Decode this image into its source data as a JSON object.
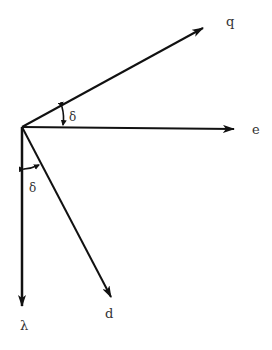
{
  "diagram": {
    "type": "vector-diagram",
    "origin": {
      "x": 22,
      "y": 127
    },
    "colors": {
      "line": "#111111",
      "text": "#333333",
      "background": "#ffffff"
    },
    "vectors": [
      {
        "id": "q",
        "label": "q",
        "tip": {
          "x": 203,
          "y": 28
        },
        "label_pos": {
          "x": 226,
          "y": 26
        }
      },
      {
        "id": "e",
        "label": "e",
        "tip": {
          "x": 234,
          "y": 129
        },
        "label_pos": {
          "x": 252,
          "y": 134
        }
      },
      {
        "id": "d",
        "label": "d",
        "tip": {
          "x": 111,
          "y": 297
        },
        "label_pos": {
          "x": 105,
          "y": 318
        }
      },
      {
        "id": "lambda",
        "label": "λ",
        "tip": {
          "x": 22,
          "y": 306
        },
        "label_pos": {
          "x": 20,
          "y": 330
        }
      }
    ],
    "angles": [
      {
        "id": "delta-upper",
        "label": "δ",
        "between": [
          "e",
          "q"
        ],
        "label_pos": {
          "x": 69,
          "y": 121
        }
      },
      {
        "id": "delta-lower",
        "label": "δ",
        "between": [
          "lambda",
          "d"
        ],
        "label_pos": {
          "x": 29,
          "y": 192
        }
      }
    ]
  }
}
